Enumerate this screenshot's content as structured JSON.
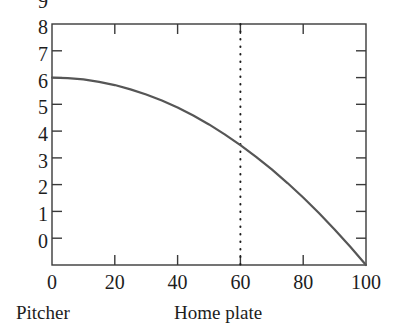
{
  "chart_data": {
    "type": "line",
    "title": "",
    "subtitle": "",
    "xlabel": "",
    "ylabel": "",
    "xlim": [
      0,
      100
    ],
    "ylim": [
      0,
      9
    ],
    "grid": false,
    "legend": null,
    "x_ticks": [
      0,
      20,
      40,
      60,
      80,
      100
    ],
    "x_tick_labels": [
      "0",
      "20",
      "40",
      "60",
      "80",
      "100"
    ],
    "x_minor_ticks": [
      20,
      40,
      60,
      80
    ],
    "y_ticks": [
      0,
      1,
      2,
      3,
      4,
      5,
      6,
      7,
      8,
      9
    ],
    "y_tick_labels": [
      "0",
      "1",
      "2",
      "3",
      "4",
      "5",
      "6",
      "7",
      "8",
      "9"
    ],
    "series": [
      {
        "name": "ball trajectory",
        "color": "#565656",
        "linewidth": 2.2,
        "style": "solid",
        "x": [
          0,
          5,
          10,
          15,
          20,
          25,
          30,
          35,
          40,
          45,
          50,
          55,
          60,
          65,
          70,
          75,
          80,
          85,
          90,
          95,
          100
        ],
        "y": [
          7.0,
          6.98,
          6.93,
          6.84,
          6.72,
          6.56,
          6.37,
          6.14,
          5.88,
          5.58,
          5.25,
          4.88,
          4.48,
          4.04,
          3.57,
          3.06,
          2.52,
          1.94,
          1.33,
          0.68,
          0.0
        ]
      }
    ],
    "annotations": [
      {
        "name": "marker-line",
        "type": "vertical-line",
        "x": 60,
        "y_from": 0,
        "y_to": 9,
        "style": "dotted",
        "color": "#1d1d1d"
      }
    ],
    "region_labels": [
      {
        "name": "pitcher",
        "text": "Pitcher",
        "x": 0
      },
      {
        "name": "home-plate",
        "text": "Home plate",
        "x": 60
      }
    ],
    "frame": {
      "color": "#3a3a3a",
      "linewidth": 1.4,
      "top": true,
      "right": true,
      "bottom": true,
      "left": true,
      "ticks_direction": "in"
    }
  },
  "labels": {
    "y": {
      "t0": "0",
      "t1": "1",
      "t2": "2",
      "t3": "3",
      "t4": "4",
      "t5": "5",
      "t6": "6",
      "t7": "7",
      "t8": "8",
      "t9": "9"
    },
    "x": {
      "t0": "0",
      "t20": "20",
      "t40": "40",
      "t60": "60",
      "t80": "80",
      "t100": "100"
    },
    "regions": {
      "pitcher": "Pitcher",
      "home_plate": "Home plate"
    }
  }
}
